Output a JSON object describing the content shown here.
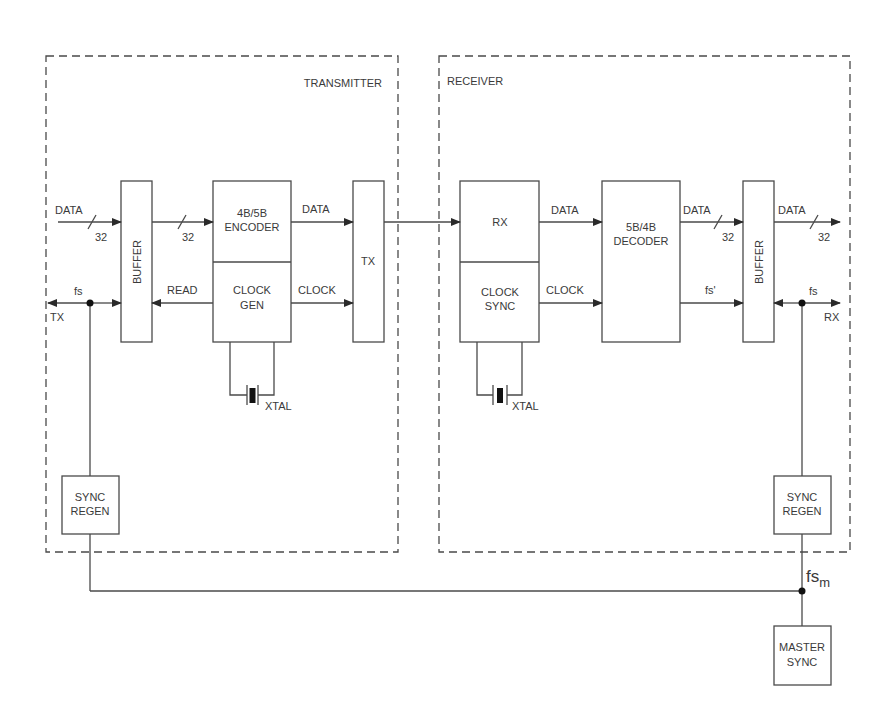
{
  "diagram": {
    "type": "block-diagram",
    "colors": {
      "line": "#4a4a4a",
      "text": "#3a3a3a",
      "background": "#ffffff"
    },
    "regions": {
      "transmitter": {
        "label": "TRANSMITTER"
      },
      "receiver": {
        "label": "RECEIVER"
      }
    },
    "transmitter": {
      "input_data_label": "DATA",
      "input_bus_width": "32",
      "buffer_label": "BUFFER",
      "buffer_to_encoder_width": "32",
      "read_label": "READ",
      "fs_label": "fs",
      "tx_port_label": "TX",
      "encoder_line1": "4B/5B",
      "encoder_line2": "ENCODER",
      "clockgen_line1": "CLOCK",
      "clockgen_line2": "GEN",
      "data_out_label": "DATA",
      "clock_out_label": "CLOCK",
      "tx_block_label": "TX",
      "xtal_label": "XTAL",
      "sync_regen_line1": "SYNC",
      "sync_regen_line2": "REGEN"
    },
    "receiver": {
      "rx_block_label": "RX",
      "clocksync_line1": "CLOCK",
      "clocksync_line2": "SYNC",
      "data_label": "DATA",
      "clock_label": "CLOCK",
      "decoder_line1": "5B/4B",
      "decoder_line2": "DECODER",
      "decoder_data_label": "DATA",
      "decoder_bus_width": "32",
      "fs_prime_label": "fs'",
      "buffer_label": "BUFFER",
      "output_data_label": "DATA",
      "output_bus_width": "32",
      "fs_label": "fs",
      "rx_port_label": "RX",
      "xtal_label": "XTAL",
      "sync_regen_line1": "SYNC",
      "sync_regen_line2": "REGEN"
    },
    "master": {
      "fsm_label": "fs",
      "fsm_subscript": "m",
      "master_sync_line1": "MASTER",
      "master_sync_line2": "SYNC"
    }
  }
}
